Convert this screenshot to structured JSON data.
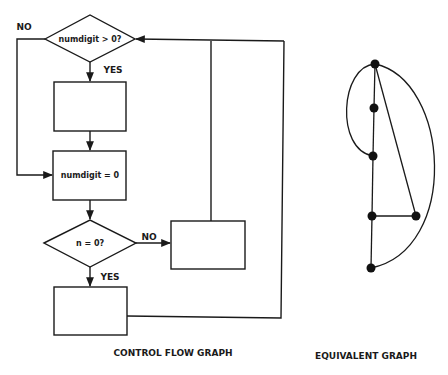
{
  "control_flow_graph": {
    "caption": "CONTROL FLOW GRAPH",
    "decision_1": {
      "text": "numdigit > 0?",
      "yes_label": "YES",
      "no_label": "NO"
    },
    "process_1": {
      "text": ""
    },
    "process_2": {
      "text": "numdigit = 0"
    },
    "decision_2": {
      "text": "n = 0?",
      "yes_label": "YES",
      "no_label": "NO"
    },
    "process_3": {
      "text": ""
    },
    "process_4": {
      "text": ""
    }
  },
  "equivalent_graph": {
    "caption": "EQUIVALENT GRAPH",
    "node_count": 6,
    "nodes": [
      {
        "id": 1,
        "x": 375,
        "y": 64
      },
      {
        "id": 2,
        "x": 374,
        "y": 108
      },
      {
        "id": 3,
        "x": 373,
        "y": 156
      },
      {
        "id": 4,
        "x": 372,
        "y": 216
      },
      {
        "id": 5,
        "x": 416,
        "y": 216
      },
      {
        "id": 6,
        "x": 371,
        "y": 268
      }
    ],
    "edges": [
      [
        1,
        2
      ],
      [
        2,
        3
      ],
      [
        3,
        4
      ],
      [
        4,
        6
      ],
      [
        4,
        5
      ],
      [
        1,
        5
      ],
      [
        1,
        3
      ],
      [
        1,
        6
      ]
    ]
  },
  "colors": {
    "line": "#1a1a1a",
    "background": "#ffffff"
  }
}
